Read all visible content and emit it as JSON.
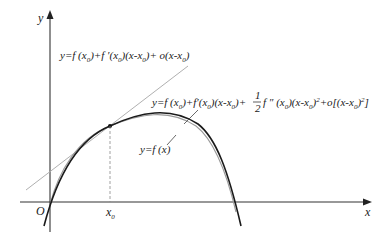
{
  "diagram": {
    "axes": {
      "x_label": "x",
      "y_label": "y",
      "origin_label": "O",
      "x0_label": "x",
      "x0_sub": "0"
    },
    "labels": {
      "tangent": {
        "prefix": "y=f (x",
        "parts": [
          "y=f (x",
          "0",
          ")+f ′(x",
          "0",
          ")(x-x",
          "0",
          ")+ o(x-x",
          "0",
          ")"
        ]
      },
      "quadratic": {
        "parts_a": [
          "y=f (x",
          "0",
          ")+f′(x",
          "0",
          ")(x-x",
          "0",
          ")+ "
        ],
        "frac_num": "1",
        "frac_den": "2",
        "parts_b": [
          "f ″ (x",
          "0",
          ")(x-x",
          "0",
          ")",
          "2",
          "+o[(x-x",
          "0",
          ")",
          "2",
          "]"
        ]
      },
      "function": "y=f (x)"
    },
    "colors": {
      "axis": "#333333",
      "curve": "#1a1a1a",
      "approx_curve": "#9a9a9a",
      "tangent_line": "#b0b0b0",
      "dashed": "#888888",
      "text": "#1a1a1a"
    }
  }
}
